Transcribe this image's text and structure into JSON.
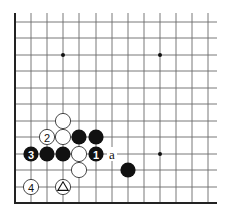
{
  "board": {
    "cols_x": [
      15,
      31,
      47,
      63,
      79,
      96,
      112,
      128,
      144,
      160,
      176,
      192,
      208
    ],
    "rows_y": [
      22,
      38,
      55,
      71,
      88,
      104,
      121,
      137,
      154,
      170,
      187,
      203
    ],
    "line_end_x": 217,
    "line_start_y": 13,
    "stone_radius": 7.6,
    "colors": {
      "black": "#111111",
      "white": "#ffffff",
      "grid": "#6a6a6a",
      "edge": "#222222"
    }
  },
  "star_points": [
    {
      "col": 3,
      "row": 2
    },
    {
      "col": 9,
      "row": 2
    },
    {
      "col": 9,
      "row": 8
    }
  ],
  "stones": [
    {
      "color": "white",
      "col": 3,
      "row": 6,
      "label": ""
    },
    {
      "color": "white",
      "col": 2,
      "row": 7,
      "label": "2"
    },
    {
      "color": "white",
      "col": 3,
      "row": 7,
      "label": ""
    },
    {
      "color": "black",
      "col": 4,
      "row": 7,
      "label": ""
    },
    {
      "color": "black",
      "col": 5,
      "row": 7,
      "label": ""
    },
    {
      "color": "black",
      "col": 1,
      "row": 8,
      "label": "3"
    },
    {
      "color": "black",
      "col": 2,
      "row": 8,
      "label": ""
    },
    {
      "color": "black",
      "col": 3,
      "row": 8,
      "label": ""
    },
    {
      "color": "white",
      "col": 4,
      "row": 8,
      "label": ""
    },
    {
      "color": "black",
      "col": 5,
      "row": 8,
      "label": "1"
    },
    {
      "color": "white",
      "col": 4,
      "row": 9,
      "label": ""
    },
    {
      "color": "black",
      "col": 7,
      "row": 9,
      "label": ""
    },
    {
      "color": "white",
      "col": 1,
      "row": 10,
      "label": "4"
    },
    {
      "color": "white",
      "col": 3,
      "row": 10,
      "label": "",
      "marker": "triangle"
    }
  ],
  "markers": [
    {
      "text": "a",
      "col": 6,
      "row": 8
    }
  ]
}
